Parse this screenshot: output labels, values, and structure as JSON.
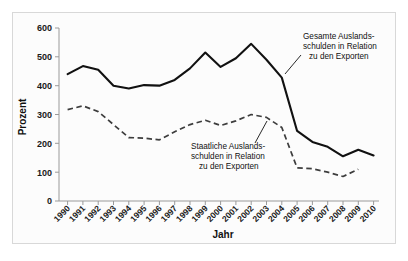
{
  "chart_data": {
    "type": "line",
    "title": "",
    "xlabel": "Jahr",
    "ylabel": "Prozent",
    "ylim": [
      0,
      600
    ],
    "yticks": [
      0,
      100,
      200,
      300,
      400,
      500,
      600
    ],
    "grid": false,
    "legend_position": "inline-annotations",
    "categories": [
      "1990",
      "1991",
      "1992",
      "1993",
      "1994",
      "1995",
      "1996",
      "1997",
      "1998",
      "1999",
      "2000",
      "2001",
      "2002",
      "2003",
      "2004",
      "2005",
      "2006",
      "2007",
      "2008",
      "2009",
      "2010"
    ],
    "series": [
      {
        "name": "Gesamte Auslandsschulden in Relation zu den Exporten",
        "style": "solid",
        "color": "#111111",
        "values": [
          440,
          468,
          455,
          400,
          390,
          402,
          400,
          420,
          460,
          515,
          465,
          495,
          545,
          490,
          428,
          243,
          205,
          188,
          155,
          178,
          158
        ]
      },
      {
        "name": "Staatliche Auslandsschulden in Relation zu den Exporten",
        "style": "dashed",
        "color": "#3d3d3d",
        "values": [
          317,
          330,
          310,
          265,
          220,
          218,
          212,
          240,
          265,
          280,
          262,
          278,
          300,
          290,
          255,
          115,
          112,
          100,
          85,
          110,
          null
        ]
      }
    ],
    "annotations": [
      {
        "id": "total-debt",
        "lines": [
          "Gesamte Auslands-",
          "schulden in Relation",
          "zu den Exporten"
        ],
        "target_year": "2004"
      },
      {
        "id": "state-debt",
        "lines": [
          "Staatliche Auslands-",
          "schulden in Relation",
          "zu den Exporten"
        ],
        "target_year": "2003"
      }
    ]
  }
}
